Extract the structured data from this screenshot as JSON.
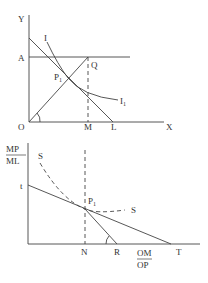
{
  "top_panel": {
    "axis_y_label": "Y",
    "axis_x_label": "X",
    "origin_label": "O",
    "point_A": "A",
    "point_Q": "Q",
    "point_P": "P",
    "point_P_sub": "1",
    "point_M": "M",
    "point_L": "L",
    "curve_I": "I",
    "curve_I1": "I",
    "curve_I1_sub": "1"
  },
  "bottom_panel": {
    "y_label_num": "MP",
    "y_label_den": "ML",
    "point_t": "t",
    "curve_S_left": "S",
    "curve_S_right": "S",
    "point_P": "P",
    "point_P_sub": "1",
    "point_N": "N",
    "point_R": "R",
    "point_T": "T",
    "x_label_num": "OM",
    "x_label_den": "OP"
  },
  "colors": {
    "line": "#444444",
    "text": "#333333"
  }
}
